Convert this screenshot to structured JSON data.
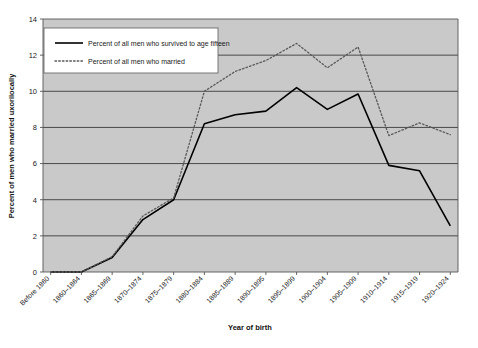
{
  "chart_data": {
    "type": "line",
    "title": "",
    "xlabel": "Year of birth",
    "ylabel": "Percent of men who married uxorilocally",
    "ylim": [
      0,
      14
    ],
    "ytick_values": [
      0,
      2,
      4,
      6,
      8,
      10,
      12,
      14
    ],
    "grid": true,
    "legend_position": "top-left",
    "categories": [
      "Before 1860",
      "1860–1864",
      "1865–1869",
      "1870–1874",
      "1875–1879",
      "1880–1884",
      "1885–1889",
      "1890–1895",
      "1895–1899",
      "1900–1904",
      "1905–1909",
      "1910–1914",
      "1915–1919",
      "1920–1924"
    ],
    "series": [
      {
        "name": "Percent of all men who survived to age fifteen",
        "style": "solid",
        "color": "#000000",
        "values": [
          0.0,
          0.0,
          0.8,
          2.9,
          4.0,
          8.2,
          8.7,
          8.9,
          10.2,
          9.0,
          9.85,
          5.9,
          5.6,
          2.55
        ]
      },
      {
        "name": "Percent of all men who married",
        "style": "dotted",
        "color": "#595959",
        "values": [
          0.0,
          0.0,
          0.85,
          3.1,
          4.1,
          10.0,
          11.1,
          11.7,
          12.65,
          11.3,
          12.45,
          7.55,
          8.25,
          7.6
        ]
      }
    ]
  },
  "axes": {
    "y_title": "Percent of men who married uxorilocally",
    "x_title": "Year of birth",
    "y_ticks": [
      "0",
      "2",
      "4",
      "6",
      "8",
      "10",
      "12",
      "14"
    ]
  },
  "legend": {
    "items": [
      {
        "label": "Percent of all men who survived to age fifteen",
        "style": "solid"
      },
      {
        "label": "Percent of all men who married",
        "style": "dotted"
      }
    ]
  },
  "colors": {
    "plot_background": "#c9c9c9",
    "gridline": "#4a4a4a",
    "axis": "#555555",
    "series_solid": "#000000",
    "series_dotted": "#5a5a5a",
    "legend_background": "#ffffff",
    "legend_border": "#6b6b6b",
    "page_background": "#ffffff"
  }
}
